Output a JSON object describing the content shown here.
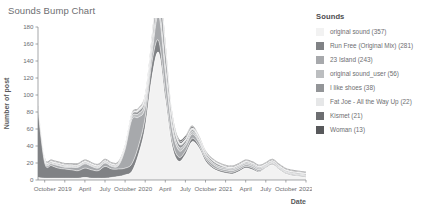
{
  "chart_title": "Sounds Bump Chart",
  "legend": {
    "title": "Sounds",
    "items": [
      {
        "label": "original sound (357)",
        "color": "#f2f2f2"
      },
      {
        "label": "Run Free (Original Mix) (281)",
        "color": "#808285"
      },
      {
        "label": "23 Island (243)",
        "color": "#a7a9ac"
      },
      {
        "label": "original sound_user (56)",
        "color": "#bcbec0"
      },
      {
        "label": "I like shoes (38)",
        "color": "#939598"
      },
      {
        "label": "Fat Joe - All the Way Up (22)",
        "color": "#e6e7e8"
      },
      {
        "label": "Kismet (21)",
        "color": "#6d6e71"
      },
      {
        "label": "Woman (13)",
        "color": "#58595b"
      }
    ]
  },
  "chart_data": {
    "type": "area",
    "stacked": true,
    "title": "Sounds Bump Chart",
    "xlabel": "Date",
    "ylabel": "Number of post",
    "ylim": [
      0,
      180
    ],
    "yticks": [
      0,
      20,
      40,
      60,
      80,
      100,
      120,
      140,
      160,
      180
    ],
    "grid": false,
    "legend_position": "right",
    "x": [
      "2018-09",
      "2018-10",
      "2018-11",
      "2018-12",
      "2019-01",
      "2019-02",
      "2019-03",
      "2019-04",
      "2019-05",
      "2019-06",
      "2019-07",
      "2019-08",
      "2019-09",
      "2019-10",
      "2019-11",
      "2019-12",
      "2020-01",
      "2020-02",
      "2020-03",
      "2020-04",
      "2020-05",
      "2020-06",
      "2020-07",
      "2020-08",
      "2020-09",
      "2020-10",
      "2020-11",
      "2020-12",
      "2021-01",
      "2021-02",
      "2021-03",
      "2021-04",
      "2021-05",
      "2021-06",
      "2021-07",
      "2021-08",
      "2021-09",
      "2021-10",
      "2021-11",
      "2021-12",
      "2022-01"
    ],
    "xtick_labels": [
      "October",
      "2019",
      "April",
      "July",
      "October",
      "2020",
      "April",
      "July",
      "October",
      "2021",
      "April",
      "July",
      "October",
      "2022"
    ],
    "xtick_x": [
      "2018-10",
      "2019-01",
      "2019-04",
      "2019-07",
      "2019-10",
      "2020-01",
      "2020-04",
      "2020-07",
      "2020-10",
      "2021-01",
      "2021-04",
      "2021-07",
      "2021-10",
      "2022-01"
    ],
    "series": [
      {
        "name": "original sound (357)",
        "color": "#f2f2f2",
        "values": [
          3,
          2,
          2,
          2,
          2,
          2,
          2,
          3,
          2,
          2,
          2,
          3,
          4,
          6,
          10,
          30,
          62,
          120,
          150,
          95,
          40,
          22,
          30,
          45,
          38,
          22,
          14,
          10,
          8,
          7,
          10,
          14,
          12,
          9,
          14,
          18,
          12,
          7,
          5,
          4,
          3
        ]
      },
      {
        "name": "Run Free (Original Mix) (281)",
        "color": "#808285",
        "values": [
          78,
          18,
          15,
          12,
          11,
          10,
          9,
          11,
          10,
          9,
          14,
          10,
          9,
          8,
          9,
          10,
          12,
          18,
          14,
          10,
          7,
          5,
          4,
          4,
          3,
          3,
          2,
          2,
          2,
          2,
          2,
          2,
          2,
          1,
          1,
          1,
          1,
          1,
          1,
          1,
          1
        ]
      },
      {
        "name": "23 Island (243)",
        "color": "#a7a9ac",
        "values": [
          2,
          2,
          2,
          3,
          2,
          3,
          4,
          5,
          4,
          3,
          4,
          3,
          4,
          22,
          52,
          34,
          12,
          10,
          30,
          22,
          14,
          8,
          6,
          5,
          4,
          3,
          3,
          2,
          2,
          2,
          2,
          2,
          2,
          2,
          1,
          1,
          1,
          1,
          1,
          1,
          1
        ]
      },
      {
        "name": "original sound_user (56)",
        "color": "#bcbec0",
        "values": [
          1,
          1,
          1,
          1,
          1,
          1,
          1,
          1,
          1,
          1,
          1,
          1,
          1,
          2,
          3,
          4,
          6,
          8,
          10,
          8,
          5,
          4,
          3,
          3,
          2,
          2,
          2,
          2,
          2,
          2,
          2,
          2,
          2,
          2,
          1,
          1,
          1,
          1,
          1,
          1,
          1
        ]
      },
      {
        "name": "I like shoes (38)",
        "color": "#939598",
        "values": [
          1,
          1,
          1,
          1,
          1,
          1,
          1,
          1,
          1,
          1,
          1,
          1,
          1,
          1,
          2,
          3,
          4,
          6,
          24,
          18,
          8,
          4,
          3,
          2,
          2,
          2,
          2,
          2,
          1,
          1,
          1,
          1,
          1,
          1,
          1,
          1,
          1,
          1,
          1,
          1,
          1
        ]
      },
      {
        "name": "Fat Joe - All the Way Up (22)",
        "color": "#e6e7e8",
        "values": [
          1,
          1,
          1,
          1,
          1,
          1,
          1,
          1,
          1,
          1,
          1,
          1,
          1,
          1,
          1,
          2,
          3,
          4,
          5,
          4,
          3,
          2,
          2,
          2,
          2,
          1,
          1,
          1,
          1,
          1,
          1,
          1,
          1,
          1,
          1,
          1,
          1,
          1,
          1,
          1,
          1
        ]
      },
      {
        "name": "Kismet (21)",
        "color": "#6d6e71",
        "values": [
          1,
          1,
          1,
          1,
          1,
          1,
          1,
          1,
          1,
          1,
          1,
          1,
          1,
          1,
          1,
          1,
          2,
          3,
          4,
          3,
          2,
          2,
          2,
          2,
          1,
          1,
          1,
          1,
          1,
          1,
          1,
          1,
          1,
          1,
          1,
          1,
          1,
          1,
          1,
          1,
          1
        ]
      },
      {
        "name": "Woman (13)",
        "color": "#58595b",
        "values": [
          1,
          1,
          1,
          1,
          1,
          1,
          1,
          1,
          1,
          1,
          1,
          1,
          1,
          1,
          1,
          1,
          1,
          2,
          6,
          5,
          3,
          2,
          2,
          1,
          1,
          1,
          1,
          1,
          1,
          1,
          1,
          1,
          1,
          1,
          1,
          1,
          1,
          1,
          1,
          1,
          1
        ]
      }
    ]
  }
}
